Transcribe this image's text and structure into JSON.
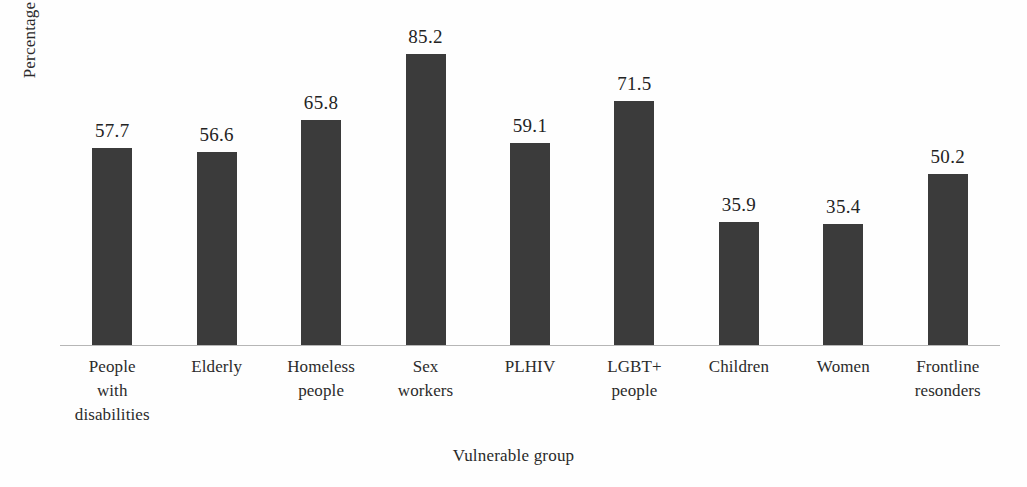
{
  "chart_data": {
    "type": "bar",
    "title": "",
    "subtitle": "",
    "xlabel": "Vulnerable group",
    "ylabel": "Percentage",
    "categories": [
      "People with disabilities",
      "Elderly",
      "Homeless people",
      "Sex workers",
      "PLHIV",
      "LGBT+ people",
      "Children",
      "Women",
      "Frontline resonders"
    ],
    "category_lines": [
      [
        "People",
        "with",
        "disabilities"
      ],
      [
        "Elderly"
      ],
      [
        "Homeless",
        "people"
      ],
      [
        "Sex",
        "workers"
      ],
      [
        "PLHIV"
      ],
      [
        "LGBT+",
        "people"
      ],
      [
        "Children"
      ],
      [
        "Women"
      ],
      [
        "Frontline",
        "resonders"
      ]
    ],
    "values": [
      57.7,
      56.6,
      65.8,
      85.2,
      59.1,
      71.5,
      35.9,
      35.4,
      50.2
    ],
    "value_labels": [
      "57.7",
      "56.6",
      "65.8",
      "85.2",
      "59.1",
      "71.5",
      "35.9",
      "35.4",
      "50.2"
    ],
    "ylim": [
      0,
      101
    ],
    "grid": false,
    "legend": false,
    "legend_position": "none",
    "axis_ticks": false,
    "bar_color": "#3b3b3b",
    "axis_line_color": "#b6b6b6",
    "background_color": "#fefefe",
    "text_color": "#232323"
  }
}
